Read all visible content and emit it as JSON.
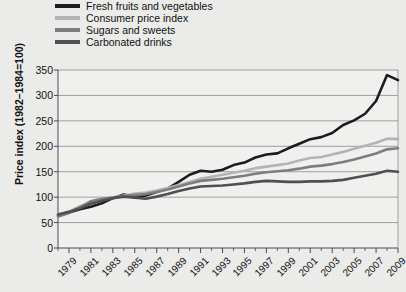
{
  "chart_data": {
    "type": "line",
    "title": "",
    "xlabel": "",
    "ylabel": "Price index (1982–1984=100)",
    "ylim": [
      0,
      350
    ],
    "yticks": [
      0,
      50,
      100,
      150,
      200,
      250,
      300,
      350
    ],
    "xlim": [
      1978,
      2009
    ],
    "xticks": [
      1979,
      1981,
      1983,
      1985,
      1987,
      1989,
      1991,
      1993,
      1995,
      1997,
      1999,
      2001,
      2003,
      2005,
      2007,
      2009
    ],
    "x": [
      1978,
      1979,
      1980,
      1981,
      1982,
      1983,
      1984,
      1985,
      1986,
      1987,
      1988,
      1989,
      1990,
      1991,
      1992,
      1993,
      1994,
      1995,
      1996,
      1997,
      1998,
      1999,
      2000,
      2001,
      2002,
      2003,
      2004,
      2005,
      2006,
      2007,
      2008,
      2009
    ],
    "grid": "horizontal",
    "legend_position": "above-plot",
    "series": [
      {
        "name": "Fresh fruits and vegetables",
        "color": "#1c1c1c",
        "width": 2.6,
        "values": [
          63,
          70,
          76,
          81,
          88,
          98,
          105,
          100,
          103,
          110,
          117,
          130,
          144,
          152,
          150,
          154,
          163,
          168,
          178,
          184,
          186,
          196,
          205,
          214,
          218,
          226,
          242,
          251,
          264,
          289,
          340,
          330
        ]
      },
      {
        "name": "Consumer price index",
        "color": "#b4b4b4",
        "width": 2.6,
        "values": [
          65,
          72,
          82,
          90,
          96,
          99,
          103,
          107,
          109,
          113,
          118,
          124,
          130,
          136,
          140,
          144,
          148,
          152,
          157,
          160,
          163,
          166,
          172,
          177,
          179,
          184,
          189,
          195,
          201,
          207,
          215,
          214
        ]
      },
      {
        "name": "Sugars and sweets",
        "color": "#7d7d7d",
        "width": 2.6,
        "values": [
          62,
          69,
          80,
          92,
          97,
          99,
          102,
          104,
          106,
          110,
          115,
          121,
          127,
          132,
          134,
          136,
          139,
          142,
          146,
          149,
          151,
          153,
          156,
          160,
          162,
          165,
          169,
          174,
          180,
          186,
          194,
          196
        ]
      },
      {
        "name": "Carbonated drinks",
        "color": "#4f4f4f",
        "width": 2.6,
        "values": [
          66,
          71,
          78,
          87,
          93,
          98,
          101,
          99,
          97,
          101,
          106,
          112,
          117,
          121,
          122,
          123,
          125,
          127,
          130,
          132,
          131,
          130,
          130,
          131,
          131,
          132,
          134,
          138,
          142,
          146,
          152,
          150
        ]
      }
    ]
  },
  "legend": {
    "items": [
      {
        "label": "Fresh fruits and vegetables",
        "color": "#1c1c1c"
      },
      {
        "label": "Consumer price index",
        "color": "#b4b4b4"
      },
      {
        "label": "Sugars and sweets",
        "color": "#7d7d7d"
      },
      {
        "label": "Carbonated drinks",
        "color": "#4f4f4f"
      }
    ]
  }
}
